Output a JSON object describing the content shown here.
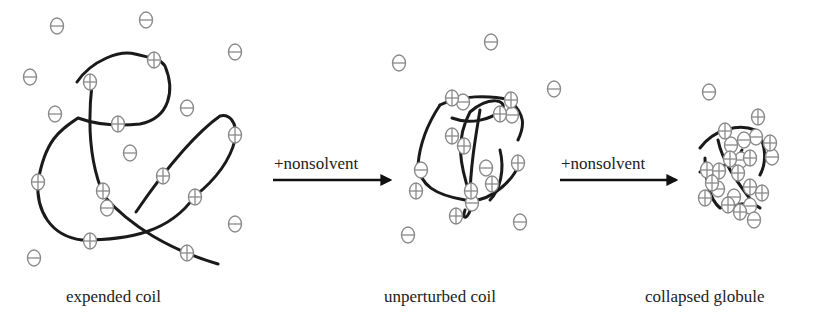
{
  "diagram": {
    "stages": [
      {
        "label": "expended coil",
        "label_x": 66,
        "label_y": 287
      },
      {
        "label": "unperturbed coil",
        "label_x": 384,
        "label_y": 287
      },
      {
        "label": "collapsed globule",
        "label_x": 645,
        "label_y": 287
      }
    ],
    "arrows": [
      {
        "label": "+nonsolvent",
        "x1": 273,
        "x2": 390,
        "y": 180,
        "label_x": 274,
        "label_y": 154
      },
      {
        "label": "+nonsolvent",
        "x1": 560,
        "x2": 676,
        "y": 180,
        "label_x": 561,
        "label_y": 154
      }
    ],
    "colors": {
      "chain": "#1a1a1a",
      "ion_stroke": "#8a8a8a",
      "arrow": "#111111",
      "text": "#222222"
    },
    "chains": [
      "M77,82 C92,60 120,50 135,54 C150,58 160,58 165,66 C175,90 170,118 140,124 C120,126 100,126 78,118 C60,130 45,140 38,182 C36,210 50,236 82,240 C130,240 170,232 195,196 C215,180 230,160 235,140 C238,120 228,114 220,116 C200,130 170,162 136,212",
      "M92,84 C88,120 88,160 104,196 C130,226 170,250 218,264",
      "M440,105 C430,120 420,140 418,165 C420,185 435,195 465,200 C490,205 520,175 520,158",
      "M440,105 C460,95 490,95 510,100 C525,115 525,125 518,140",
      "M452,118 C470,125 490,120 502,110 C508,100 490,95 470,112 C455,140 460,165 470,195 C475,215 460,225 465,210",
      "M480,110 C475,140 470,170 470,200",
      "M500,150 C505,170 500,190 490,200",
      "M700,148 C715,128 740,124 755,130 C765,140 768,160 760,175",
      "M718,140 C722,160 735,180 755,205",
      "M705,158 C705,180 710,200 720,208 C735,205 750,200 760,208",
      "M700,172 C715,168 735,166 742,150"
    ],
    "positive_ions": [
      [
        90,
        82
      ],
      [
        154,
        60
      ],
      [
        118,
        124
      ],
      [
        235,
        135
      ],
      [
        38,
        182
      ],
      [
        103,
        191
      ],
      [
        163,
        176
      ],
      [
        195,
        197
      ],
      [
        90,
        241
      ],
      [
        187,
        253
      ],
      [
        452,
        98
      ],
      [
        511,
        100
      ],
      [
        500,
        114
      ],
      [
        452,
        136
      ],
      [
        464,
        146
      ],
      [
        518,
        163
      ],
      [
        416,
        191
      ],
      [
        471,
        191
      ],
      [
        492,
        184
      ],
      [
        456,
        216
      ],
      [
        758,
        117
      ],
      [
        725,
        131
      ],
      [
        770,
        143
      ],
      [
        730,
        159
      ],
      [
        750,
        158
      ],
      [
        707,
        170
      ],
      [
        719,
        171
      ],
      [
        738,
        173
      ],
      [
        750,
        187
      ],
      [
        712,
        183
      ],
      [
        762,
        193
      ],
      [
        728,
        205
      ],
      [
        705,
        198
      ],
      [
        740,
        212
      ]
    ],
    "negative_ions": [
      [
        57,
        26
      ],
      [
        146,
        20
      ],
      [
        235,
        52
      ],
      [
        30,
        77
      ],
      [
        55,
        114
      ],
      [
        187,
        108
      ],
      [
        130,
        153
      ],
      [
        107,
        208
      ],
      [
        235,
        224
      ],
      [
        34,
        258
      ],
      [
        491,
        42
      ],
      [
        399,
        63
      ],
      [
        554,
        89
      ],
      [
        463,
        102
      ],
      [
        512,
        115
      ],
      [
        421,
        170
      ],
      [
        486,
        168
      ],
      [
        472,
        203
      ],
      [
        520,
        222
      ],
      [
        408,
        235
      ],
      [
        709,
        92
      ],
      [
        756,
        137
      ],
      [
        744,
        140
      ],
      [
        731,
        145
      ],
      [
        741,
        160
      ],
      [
        772,
        157
      ],
      [
        718,
        189
      ],
      [
        734,
        197
      ],
      [
        750,
        206
      ],
      [
        754,
        220
      ]
    ]
  }
}
